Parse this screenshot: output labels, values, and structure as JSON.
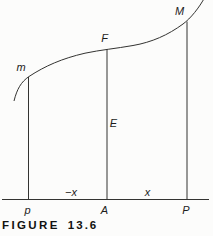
{
  "figure": {
    "curve_points": {
      "m": "m",
      "F": "F",
      "M": "M"
    },
    "segment_label": {
      "E": "E"
    },
    "axis_points": {
      "p": "p",
      "A": "A",
      "P": "P"
    },
    "interval_labels": {
      "left": "−x",
      "right": "x"
    },
    "caption": {
      "label": "FIGURE",
      "number": "13.6"
    },
    "colors": {
      "line": "#333331",
      "text": "#1d1d1b",
      "background": "#fcfcfb"
    }
  }
}
